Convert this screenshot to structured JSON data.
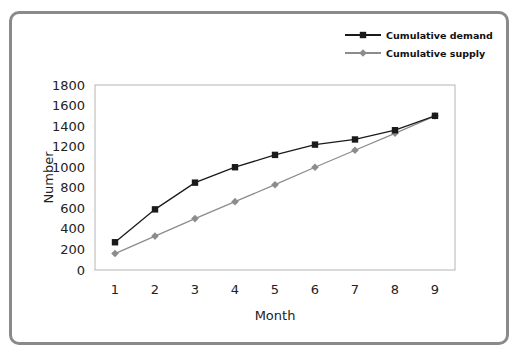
{
  "chart_data": {
    "type": "line",
    "title": "",
    "xlabel": "Month",
    "ylabel": "Number",
    "x": [
      1,
      2,
      3,
      4,
      5,
      6,
      7,
      8,
      9
    ],
    "x_tick_labels": [
      "1",
      "2",
      "3",
      "4",
      "5",
      "6",
      "7",
      "8",
      "9"
    ],
    "y_tick_labels": [
      "0",
      "200",
      "400",
      "600",
      "800",
      "1000",
      "1200",
      "1400",
      "1600",
      "1800"
    ],
    "y_ticks": [
      0,
      200,
      400,
      600,
      800,
      1000,
      1200,
      1400,
      1600,
      1800
    ],
    "ylim": [
      0,
      1800
    ],
    "grid": false,
    "legend_position": "top-right",
    "series": [
      {
        "name": "Cumulative demand",
        "color": "#1a1a1a",
        "marker": "square",
        "values": [
          270,
          590,
          850,
          1000,
          1120,
          1220,
          1270,
          1360,
          1500
        ]
      },
      {
        "name": "Cumulative supply",
        "color": "#8c8c8c",
        "marker": "diamond",
        "values": [
          160,
          330,
          500,
          665,
          830,
          1000,
          1165,
          1330,
          1500
        ]
      }
    ]
  }
}
